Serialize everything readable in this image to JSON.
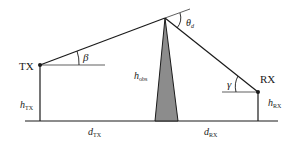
{
  "diagram": {
    "type": "knife-edge diffraction geometry",
    "colors": {
      "line": "#1a1a1a",
      "obstacle_fill": "#8c8c8c",
      "background": "#ffffff"
    },
    "labels": {
      "tx": "TX",
      "rx": "RX",
      "beta": "β",
      "gamma": "γ",
      "theta": "θ",
      "theta_sub": "d",
      "h_tx": "h",
      "h_tx_sub": "TX",
      "h_rx": "h",
      "h_rx_sub": "RX",
      "h_obs": "h",
      "h_obs_sub": "obs",
      "d_tx": "d",
      "d_tx_sub": "TX",
      "d_rx": "d",
      "d_rx_sub": "RX"
    }
  }
}
